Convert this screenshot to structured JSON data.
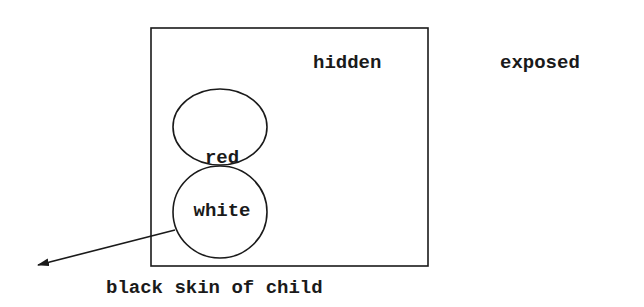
{
  "diagram": {
    "region_labels": {
      "inside": "hidden",
      "outside": "exposed"
    },
    "circles": [
      {
        "label": "red"
      },
      {
        "label": "white"
      }
    ],
    "arrow_label": "black skin of child",
    "colors": {
      "stroke": "#1a1a1a",
      "background": "#ffffff"
    }
  }
}
